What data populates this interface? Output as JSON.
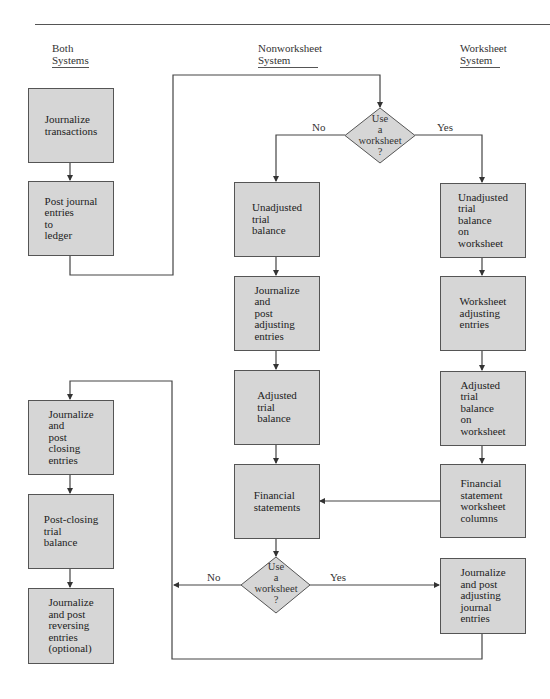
{
  "columns": {
    "both": {
      "line1": "Both",
      "line2": "Systems"
    },
    "nonworksheet": {
      "line1": "Nonworksheet",
      "line2": "System"
    },
    "worksheet": {
      "line1": "Worksheet",
      "line2": "System"
    }
  },
  "nodes": {
    "journalize_transactions": "Journalize\ntransactions",
    "post_to_ledger": "Post journal\nentries\nto\nledger",
    "unadjusted_tb": "Unadjusted\ntrial\nbalance",
    "journalize_post_adjusting": "Journalize\nand\npost\nadjusting\nentries",
    "adjusted_tb": "Adjusted\ntrial\nbalance",
    "financial_statements": "Financial\nstatements",
    "ws_unadjusted_tb": "Unadjusted\ntrial\nbalance\non\nworksheet",
    "ws_adjusting_entries": "Worksheet\nadjusting\nentries",
    "ws_adjusted_tb": "Adjusted\ntrial\nbalance\non\nworksheet",
    "ws_fs_columns": "Financial\nstatement\nworksheet\ncolumns",
    "ws_journalize_adjusting": "Journalize\nand post\nadjusting\njournal\nentries",
    "closing_entries": "Journalize\nand\npost\nclosing\nentries",
    "post_closing_tb": "Post-closing\ntrial\nbalance",
    "reversing_entries": "Journalize\nand post\nreversing\nentries\n(optional)"
  },
  "decisions": {
    "top": {
      "text": "Use\na\nworksheet\n?",
      "no": "No",
      "yes": "Yes"
    },
    "bottom": {
      "text": "Use\na\nworksheet\n?",
      "no": "No",
      "yes": "Yes"
    }
  },
  "colors": {
    "box_fill": "#d6d6d6",
    "box_border": "#555555",
    "line": "#444444",
    "text": "#222222"
  }
}
